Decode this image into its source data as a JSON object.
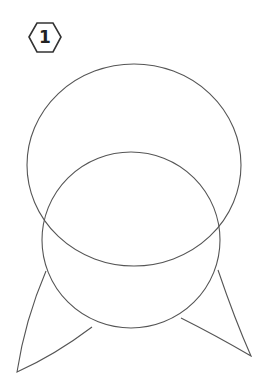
{
  "badge": {
    "label": "1"
  },
  "colors": {
    "stroke": "#555555",
    "badge_stroke": "#333333",
    "background": "#ffffff"
  },
  "shapes": {
    "upper_circle": {
      "cx": 134,
      "cy": 165,
      "rx": 107,
      "ry": 101
    },
    "lower_circle": {
      "cx": 131,
      "cy": 240,
      "rx": 89,
      "ry": 88
    },
    "left_ear": "left-ear",
    "right_ear": "right-ear"
  }
}
